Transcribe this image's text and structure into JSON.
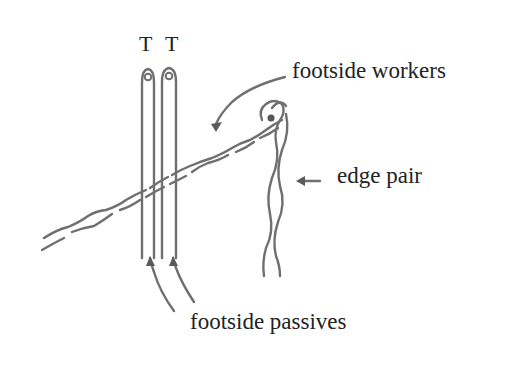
{
  "diagram": {
    "stroke_color": "#6f6f6f",
    "text_color": "#222222",
    "background": "#ffffff",
    "pins": [
      {
        "label": "T"
      },
      {
        "label": "T"
      }
    ],
    "labels": {
      "footside_workers": "footside workers",
      "edge_pair": "edge pair",
      "footside_passives": "footside passives"
    }
  }
}
